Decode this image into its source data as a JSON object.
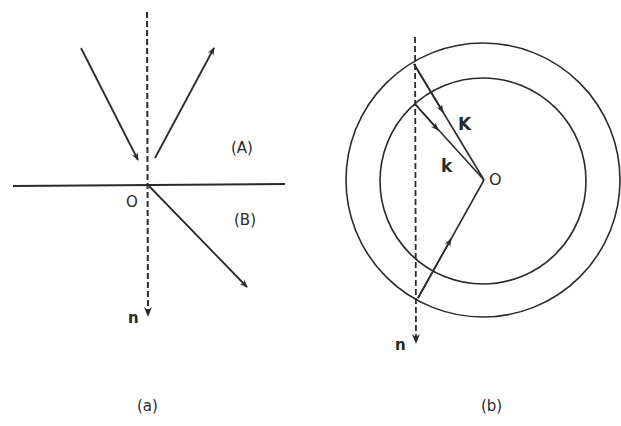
{
  "panel_a": {
    "caption": "(a)",
    "region_upper": "(A)",
    "region_lower": "(B)",
    "origin": "O",
    "normal": "n"
  },
  "panel_b": {
    "caption": "(b)",
    "vector_outer": "K",
    "vector_inner": "k",
    "origin": "O",
    "normal": "n"
  },
  "colors": {
    "ink": "#2a2a2a",
    "background": "#ffffff"
  }
}
